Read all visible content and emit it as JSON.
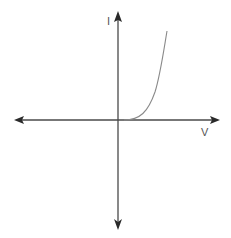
{
  "diagram": {
    "axes": {
      "x_label": "V",
      "y_label": "I",
      "color": "#3a3a3a"
    },
    "curve": {
      "description": "Exponential-like current rise for positive voltage",
      "color": "#8a8a8a"
    }
  }
}
